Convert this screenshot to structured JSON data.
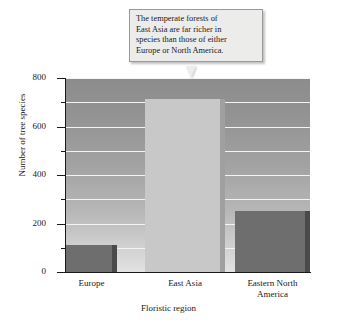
{
  "callout": {
    "lines": [
      "The temperate forests of",
      "East Asia are far richer in",
      "species than those of either",
      "Europe or North America."
    ]
  },
  "chart_data": {
    "type": "bar",
    "title": "",
    "xlabel": "Floristic region",
    "ylabel": "Number of tree species",
    "categories": [
      "Europe",
      "East Asia",
      "Eastern North America"
    ],
    "category_lines": [
      [
        "Europe"
      ],
      [
        "East Asia"
      ],
      [
        "Eastern North",
        "America"
      ]
    ],
    "values": [
      110,
      715,
      250
    ],
    "ylim": [
      0,
      800
    ],
    "ytick_major": [
      0,
      200,
      400,
      600,
      800
    ],
    "ytick_minor": [
      100,
      300,
      500,
      700
    ],
    "ytick_labels": [
      "0",
      "200",
      "400",
      "600",
      "800"
    ],
    "gridlines": [
      100,
      200,
      300,
      400,
      500,
      600,
      700,
      800
    ],
    "grid": true,
    "legend": false,
    "annotation": "The temperate forests of East Asia are far richer in species than those of either Europe or North America.",
    "annotation_target": "East Asia",
    "colors": {
      "bar_face_default": "#6e6e6e",
      "bar_face_highlight": "#c8c8c8",
      "bar_side_default": "#4a4a4a",
      "bar_side_highlight": "#a0a0a0",
      "gridline": "#f4f4f4",
      "axis": "#1a1a1a",
      "callout_fill": "#ececeb",
      "callout_border": "#9a9a98"
    }
  }
}
